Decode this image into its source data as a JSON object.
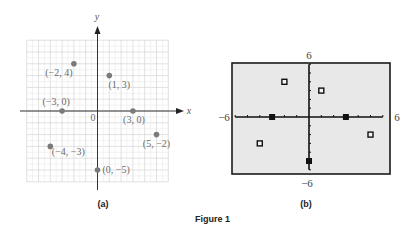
{
  "figure": {
    "caption": "Figure 1"
  },
  "panel_a": {
    "label": "(a)",
    "x_axis_label": "x",
    "y_axis_label": "y",
    "origin_label": "0",
    "grid_color": "#d8d8d8",
    "point_color": "#7a7a7a",
    "points": [
      {
        "x": -2,
        "y": 4,
        "label": "(−2, 4)"
      },
      {
        "x": 1,
        "y": 3,
        "label": "(1, 3)"
      },
      {
        "x": -3,
        "y": 0,
        "label": "(−3, 0)"
      },
      {
        "x": 3,
        "y": 0,
        "label": "(3, 0)"
      },
      {
        "x": 5,
        "y": -2,
        "label": "(5, −2)"
      },
      {
        "x": -4,
        "y": -3,
        "label": "(−4, −3)"
      },
      {
        "x": 0,
        "y": -5,
        "label": "(0, −5)"
      }
    ]
  },
  "panel_b": {
    "label": "(b)",
    "window": {
      "xmin": "−6",
      "xmax": "6",
      "ymin": "−6",
      "ymax": "6"
    },
    "background_color": "#e8e8e8",
    "points": [
      {
        "x": -2,
        "y": 4,
        "marker": "hollow-square"
      },
      {
        "x": 1,
        "y": 3,
        "marker": "hollow-square"
      },
      {
        "x": -3,
        "y": 0,
        "marker": "filled-square"
      },
      {
        "x": 3,
        "y": 0,
        "marker": "filled-square"
      },
      {
        "x": 5,
        "y": -2,
        "marker": "hollow-square"
      },
      {
        "x": -4,
        "y": -3,
        "marker": "hollow-square"
      },
      {
        "x": 0,
        "y": -5,
        "marker": "filled-square"
      }
    ]
  },
  "chart_data": [
    {
      "type": "scatter",
      "title": "(a)",
      "xlabel": "x",
      "ylabel": "y",
      "xlim": [
        -6,
        6
      ],
      "ylim": [
        -6,
        6
      ],
      "grid": true,
      "x": [
        -2,
        1,
        -3,
        3,
        5,
        -4,
        0
      ],
      "y": [
        4,
        3,
        0,
        0,
        -2,
        -3,
        -5
      ],
      "annotations": [
        "(−2, 4)",
        "(1, 3)",
        "(−3, 0)",
        "(3, 0)",
        "(5, −2)",
        "(−4, −3)",
        "(0, −5)"
      ]
    },
    {
      "type": "scatter",
      "title": "(b)",
      "xlabel": "",
      "ylabel": "",
      "xlim": [
        -6,
        6
      ],
      "ylim": [
        -6,
        6
      ],
      "grid": false,
      "tick_labels": {
        "xmin": "−6",
        "xmax": "6",
        "ymin": "−6",
        "ymax": "6"
      },
      "x": [
        -2,
        1,
        -3,
        3,
        5,
        -4,
        0
      ],
      "y": [
        4,
        3,
        0,
        0,
        -2,
        -3,
        -5
      ]
    }
  ]
}
